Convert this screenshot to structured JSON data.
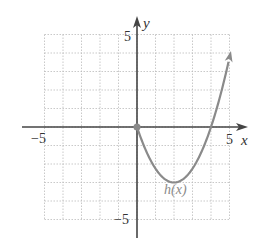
{
  "chart_data": {
    "type": "line",
    "title": "",
    "xlabel": "x",
    "ylabel": "y",
    "xlim": [
      -5,
      5
    ],
    "ylim": [
      -5,
      5
    ],
    "grid": true,
    "grid_step": 1,
    "tick_labels": {
      "x": [
        "-5",
        "5"
      ],
      "y": [
        "5",
        "-5"
      ]
    },
    "series": [
      {
        "name": "h(x)",
        "label": "h(x)",
        "color": "#888888",
        "formula": "0.75*(x^2 - 4x)",
        "x": [
          0,
          0.5,
          1,
          1.5,
          2,
          2.5,
          3,
          3.5,
          4,
          4.5,
          5
        ],
        "y": [
          0,
          -1.31,
          -2.25,
          -2.81,
          -3,
          -2.81,
          -2.25,
          -1.31,
          0,
          1.69,
          3.75
        ],
        "start_point": [
          0,
          0
        ],
        "end_arrow": true
      }
    ]
  },
  "labels": {
    "x_axis": "x",
    "y_axis": "y",
    "x_min": "−5",
    "x_max": "5",
    "y_max": "5",
    "y_min": "−5",
    "curve": "h(x)"
  },
  "colors": {
    "axis": "#444444",
    "grid": "#bbbbbb",
    "curve": "#8a8a8a"
  }
}
